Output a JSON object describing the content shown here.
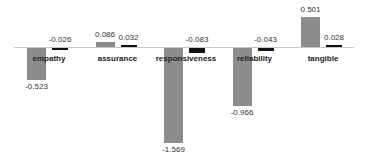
{
  "chart_data": {
    "type": "bar",
    "title": "",
    "xlabel": "",
    "ylabel": "",
    "categories": [
      "empathy",
      "assurance",
      "responsiveness",
      "reliability",
      "tangible"
    ],
    "series": [
      {
        "name": "Series 1",
        "color": "#8c8c8c",
        "values": [
          -0.523,
          0.086,
          -1.569,
          -0.966,
          0.501
        ]
      },
      {
        "name": "Series 2",
        "color": "#111111",
        "values": [
          -0.026,
          0.032,
          -0.083,
          -0.043,
          0.028
        ]
      }
    ],
    "value_labels": {
      "series1": [
        "-0.523",
        "0.086",
        "-1.569",
        "-0.966",
        "0.501"
      ],
      "series2": [
        "-0.026",
        "0.032",
        "-0.083",
        "-0.043",
        "0.028"
      ]
    },
    "ylim": [
      -1.6,
      0.55
    ],
    "grid": false,
    "legend": "none"
  }
}
